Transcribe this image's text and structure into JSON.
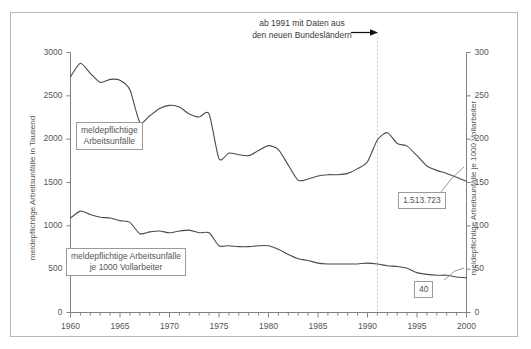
{
  "chart_data": {
    "type": "line",
    "title": "",
    "xlabel": "",
    "ylabel": "meldepflichtige Arbeitsunfälle in Tausend",
    "ylabel_right": "meldepflichtige Arbeitsunfälle je 1000 Vollarbeiter",
    "xlim": [
      1960,
      2000
    ],
    "ylim": [
      0,
      3000
    ],
    "ylim_right": [
      0,
      300
    ],
    "grid": false,
    "legend_position": "inline-labels",
    "xticks": [
      1960,
      1965,
      1970,
      1975,
      1980,
      1985,
      1990,
      1995,
      2000
    ],
    "xtick_labels": [
      "1960",
      "1965",
      "1970",
      "1975",
      "1980",
      "1985",
      "1990",
      "1995",
      "2000"
    ],
    "xminor_step": 1,
    "yticks": [
      0,
      500,
      1000,
      1500,
      2000,
      2500,
      3000
    ],
    "ytick_labels": [
      "0",
      "500",
      "1000",
      "1500",
      "2000",
      "2500",
      "3000"
    ],
    "yticks_right": [
      0,
      50,
      100,
      150,
      200,
      250,
      300
    ],
    "ytick_labels_right": [
      "0",
      "50",
      "100",
      "150",
      "200",
      "250",
      "300"
    ],
    "x": [
      1960,
      1961,
      1962,
      1963,
      1964,
      1965,
      1966,
      1967,
      1968,
      1969,
      1970,
      1971,
      1972,
      1973,
      1974,
      1975,
      1976,
      1977,
      1978,
      1979,
      1980,
      1981,
      1982,
      1983,
      1984,
      1985,
      1986,
      1987,
      1988,
      1989,
      1990,
      1991,
      1992,
      1993,
      1994,
      1995,
      1996,
      1997,
      1998,
      1999,
      2000
    ],
    "series": [
      {
        "name": "meldepflichtige Arbeitsunfälle",
        "axis": "left",
        "units": "Tausend",
        "color": "#4a4a4a",
        "values": [
          2720,
          2875,
          2760,
          2655,
          2690,
          2680,
          2570,
          2195,
          2270,
          2355,
          2390,
          2370,
          2290,
          2255,
          2290,
          1775,
          1840,
          1820,
          1810,
          1870,
          1925,
          1880,
          1700,
          1525,
          1540,
          1575,
          1590,
          1590,
          1605,
          1660,
          1740,
          1990,
          2075,
          1950,
          1920,
          1810,
          1690,
          1640,
          1605,
          1560,
          1514
        ]
      },
      {
        "name": "meldepflichtige Arbeitsunfälle je 1000 Vollarbeiter",
        "axis": "right",
        "units": "je 1000 Vollarbeiter",
        "color": "#4a4a4a",
        "values": [
          109,
          117,
          113,
          110,
          109,
          106,
          104,
          91,
          93,
          94,
          92,
          94,
          95,
          92,
          92,
          77,
          77,
          76,
          76,
          77,
          77,
          73,
          67,
          62,
          60,
          57,
          56,
          56,
          56,
          56,
          57,
          56,
          54,
          53,
          51,
          46,
          44,
          43,
          43,
          41,
          40
        ]
      }
    ],
    "annotations": [
      {
        "name": "note-new-states",
        "text_line1": "ab 1991 mit Daten aus",
        "text_line2": "den neuen Bundesländern",
        "marker_year": 1991,
        "marker_style": "dashed-vertical"
      },
      {
        "name": "value-callout-accidents",
        "text": "1.513.723",
        "points_to_year": 2000,
        "points_to_value": 1514
      },
      {
        "name": "value-callout-rate",
        "text": "40",
        "points_to_year": 2000,
        "points_to_value": 40
      }
    ]
  },
  "axes": {
    "left_title": "meldepflichtige Arbeitsunfälle in Tausend",
    "right_title": "meldepflichtige Arbeitsunfälle je 1000 Vollarbeiter",
    "y_left": {
      "t0": "0",
      "t1": "500",
      "t2": "1000",
      "t3": "1500",
      "t4": "2000",
      "t5": "2500",
      "t6": "3000"
    },
    "y_right": {
      "t0": "0",
      "t1": "50",
      "t2": "100",
      "t3": "150",
      "t4": "200",
      "t5": "250",
      "t6": "300"
    },
    "x": {
      "t0": "1960",
      "t1": "1965",
      "t2": "1970",
      "t3": "1975",
      "t4": "1980",
      "t5": "1985",
      "t6": "1990",
      "t7": "1995",
      "t8": "2000"
    }
  },
  "labels": {
    "series1_line1": "meldepflichtige",
    "series1_line2": "Arbeitsunfälle",
    "series2_line1": "meldepflichtige Arbeitsunfälle",
    "series2_line2": "je 1000 Vollarbeiter",
    "value1": "1.513.723",
    "value2": "40",
    "note_line1": "ab 1991 mit Daten aus",
    "note_line2": "den neuen Bundesländern"
  },
  "colors": {
    "line": "#4a4a4a",
    "axis": "#808080",
    "frame": "#b8b8b8",
    "text": "#555555",
    "marker_dash": "#cccccc"
  }
}
